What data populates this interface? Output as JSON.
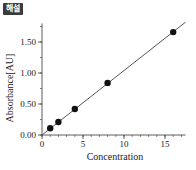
{
  "badge": {
    "label": "해설",
    "color": "#3b3b3b"
  },
  "chart_data": {
    "type": "scatter",
    "title": "",
    "xlabel": "Concentration",
    "ylabel": "Absorbance[AU]",
    "xlim": [
      0,
      17.5
    ],
    "ylim": [
      0,
      1.8
    ],
    "x_major_ticks": [
      0,
      5,
      10,
      15
    ],
    "x_tick_labels": [
      "0",
      "5",
      "10",
      "15"
    ],
    "x_minor_step": 1,
    "y_major_ticks": [
      0,
      0.5,
      1.0,
      1.5
    ],
    "y_tick_labels": [
      "0.00",
      "0.50",
      "1.00",
      "1.50"
    ],
    "y_minor_step": 0.25,
    "grid": false,
    "legend": null,
    "series": [
      {
        "name": "measurements",
        "marker": "filled-circle",
        "x": [
          1,
          2,
          4,
          8,
          16
        ],
        "y": [
          0.11,
          0.21,
          0.42,
          0.84,
          1.66
        ]
      }
    ],
    "fit_line": {
      "type": "linear",
      "slope": 0.104,
      "intercept": 0.0,
      "x_range": [
        0,
        17.5
      ]
    }
  }
}
